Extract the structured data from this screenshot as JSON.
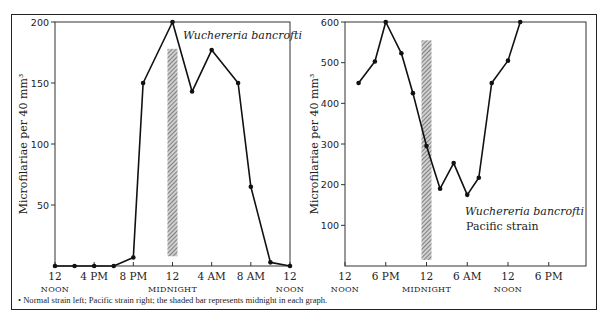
{
  "caption": "• Normal strain left; Pacific strain right; the shaded bar represents midnight in each graph.",
  "colors": {
    "line": "#111111",
    "axis": "#333333",
    "bar": "#8a8a8a"
  },
  "chart_data": [
    {
      "type": "line",
      "title": "Wuchereria bancrofti",
      "subtitle": "",
      "xlabel": "",
      "ylabel": "Microfilariae per 40 mm³",
      "ylim": [
        0,
        200
      ],
      "yticks": [
        50,
        100,
        150,
        200
      ],
      "xticks": [
        {
          "hour": 0,
          "label": "12",
          "sub": "NOON"
        },
        {
          "hour": 4,
          "label": "4 PM",
          "sub": ""
        },
        {
          "hour": 8,
          "label": "8 PM",
          "sub": ""
        },
        {
          "hour": 12,
          "label": "12",
          "sub": "MIDNIGHT"
        },
        {
          "hour": 16,
          "label": "4 AM",
          "sub": ""
        },
        {
          "hour": 20,
          "label": "8 AM",
          "sub": ""
        },
        {
          "hour": 24,
          "label": "12",
          "sub": "NOON"
        }
      ],
      "x_hours_from_noon": [
        0,
        2,
        4,
        6,
        8,
        9,
        12,
        14,
        16,
        18.7,
        20,
        22,
        24
      ],
      "series": [
        {
          "name": "Normal strain",
          "values": [
            0,
            0,
            0,
            0,
            7,
            150,
            200,
            143,
            177,
            150,
            65,
            3,
            0
          ]
        }
      ],
      "shaded_bar": {
        "label": "midnight",
        "hour_center": 12,
        "y_from": 8,
        "y_to": 178
      },
      "grid": false,
      "legend": "none"
    },
    {
      "type": "line",
      "title": "Wuchereria bancrofti",
      "subtitle": "Pacific strain",
      "xlabel": "",
      "ylabel": "Microfilariae per 40 mm³",
      "ylim": [
        0,
        600
      ],
      "yticks": [
        100,
        200,
        300,
        400,
        500,
        600
      ],
      "xticks": [
        {
          "hour": 0,
          "label": "12",
          "sub": "NOON"
        },
        {
          "hour": 6,
          "label": "6 PM",
          "sub": ""
        },
        {
          "hour": 12,
          "label": "12",
          "sub": "MIDNIGHT"
        },
        {
          "hour": 18,
          "label": "6 AM",
          "sub": ""
        },
        {
          "hour": 24,
          "label": "12",
          "sub": "NOON"
        },
        {
          "hour": 30,
          "label": "6 PM",
          "sub": ""
        }
      ],
      "x_hours_from_noon": [
        2,
        4.4,
        6,
        8.3,
        10,
        12,
        14,
        16,
        18,
        19.7,
        21.6,
        24,
        25.8
      ],
      "series": [
        {
          "name": "Pacific strain",
          "values": [
            450,
            503,
            600,
            523,
            425,
            295,
            190,
            253,
            175,
            217,
            450,
            505,
            600
          ]
        }
      ],
      "shaded_bar": {
        "label": "midnight",
        "hour_center": 12,
        "y_from": 15,
        "y_to": 555
      },
      "grid": false,
      "legend": "none"
    }
  ]
}
